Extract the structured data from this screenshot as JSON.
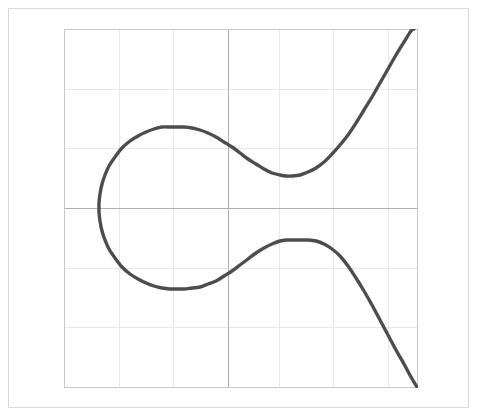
{
  "figure": {
    "title": "",
    "background_color": "#ffffff",
    "frame_color": "#d9d9d9",
    "plot_area": {
      "left": 64,
      "top": 29,
      "right": 417,
      "bottom": 387,
      "border_color": "#c9c9c9"
    }
  },
  "chart_data": {
    "type": "line",
    "title": "",
    "subtitle": "",
    "xlabel": "",
    "ylabel": "",
    "xlim": [
      -3,
      3
    ],
    "ylim": [
      -3,
      3
    ],
    "grid": true,
    "grid_color": "#e8e8e8",
    "axis_color": "#b0b0b0",
    "legend": null,
    "legend_position": "none",
    "xticks": [
      -3,
      -2,
      -1,
      0,
      1,
      2,
      3
    ],
    "yticks": [
      -3,
      -2,
      -1,
      0,
      1,
      2,
      3
    ],
    "xtick_labels": [
      "",
      "",
      "",
      "",
      "",
      "",
      ""
    ],
    "ytick_labels": [
      "",
      "",
      "",
      "",
      "",
      "",
      ""
    ],
    "annotations": [],
    "series": [
      {
        "name": "cubic",
        "color": "#4d4d4d",
        "line_width": 3.4,
        "description": "Sideways cubic: a single continuous curve entering at the lower-right, rising to a local maximum, turning left through a leftward-opening loop, and exiting at the upper-right.",
        "points": [
          [
            417,
            387
          ],
          [
            411,
            377
          ],
          [
            404,
            364
          ],
          [
            396,
            350
          ],
          [
            388,
            335
          ],
          [
            380,
            320
          ],
          [
            372,
            305
          ],
          [
            364,
            291
          ],
          [
            356,
            278
          ],
          [
            348,
            266
          ],
          [
            340,
            256
          ],
          [
            332,
            249
          ],
          [
            324,
            244
          ],
          [
            316,
            241
          ],
          [
            308,
            240
          ],
          [
            300,
            240
          ],
          [
            292,
            240
          ],
          [
            286,
            240
          ],
          [
            280,
            241
          ],
          [
            272,
            244
          ],
          [
            264,
            248
          ],
          [
            256,
            253
          ],
          [
            248,
            259
          ],
          [
            240,
            265
          ],
          [
            232,
            271
          ],
          [
            224,
            276
          ],
          [
            216,
            281
          ],
          [
            208,
            284
          ],
          [
            200,
            287
          ],
          [
            192,
            288
          ],
          [
            184,
            289
          ],
          [
            176,
            289
          ],
          [
            170,
            289
          ],
          [
            162,
            288
          ],
          [
            154,
            286
          ],
          [
            146,
            283
          ],
          [
            138,
            279
          ],
          [
            130,
            274
          ],
          [
            122,
            267
          ],
          [
            115,
            258
          ],
          [
            109,
            249
          ],
          [
            105,
            240
          ],
          [
            102,
            231
          ],
          [
            100,
            221
          ],
          [
            99,
            212
          ],
          [
            99,
            208
          ],
          [
            99,
            203
          ],
          [
            100,
            194
          ],
          [
            102,
            184
          ],
          [
            105,
            175
          ],
          [
            109,
            166
          ],
          [
            115,
            157
          ],
          [
            122,
            148
          ],
          [
            130,
            141
          ],
          [
            138,
            136
          ],
          [
            146,
            132
          ],
          [
            154,
            129
          ],
          [
            162,
            127
          ],
          [
            170,
            127
          ],
          [
            176,
            127
          ],
          [
            184,
            127
          ],
          [
            192,
            128
          ],
          [
            200,
            130
          ],
          [
            208,
            133
          ],
          [
            216,
            137
          ],
          [
            224,
            142
          ],
          [
            232,
            147
          ],
          [
            240,
            153
          ],
          [
            248,
            159
          ],
          [
            256,
            164
          ],
          [
            264,
            169
          ],
          [
            272,
            173
          ],
          [
            280,
            175
          ],
          [
            286,
            176
          ],
          [
            292,
            176
          ],
          [
            300,
            175
          ],
          [
            308,
            172
          ],
          [
            316,
            168
          ],
          [
            324,
            162
          ],
          [
            332,
            154
          ],
          [
            340,
            145
          ],
          [
            348,
            135
          ],
          [
            356,
            123
          ],
          [
            364,
            110
          ],
          [
            372,
            97
          ],
          [
            380,
            83
          ],
          [
            388,
            69
          ],
          [
            396,
            55
          ],
          [
            404,
            42
          ],
          [
            411,
            31
          ],
          [
            414,
            29
          ]
        ]
      }
    ],
    "gridlines": {
      "vertical_x": [
        64,
        119,
        173,
        228,
        279,
        333,
        388,
        417
      ],
      "horizontal_y": [
        29,
        89,
        148,
        208,
        268,
        327,
        387
      ],
      "axis_vertical_x": 228,
      "axis_horizontal_y": 208
    }
  }
}
